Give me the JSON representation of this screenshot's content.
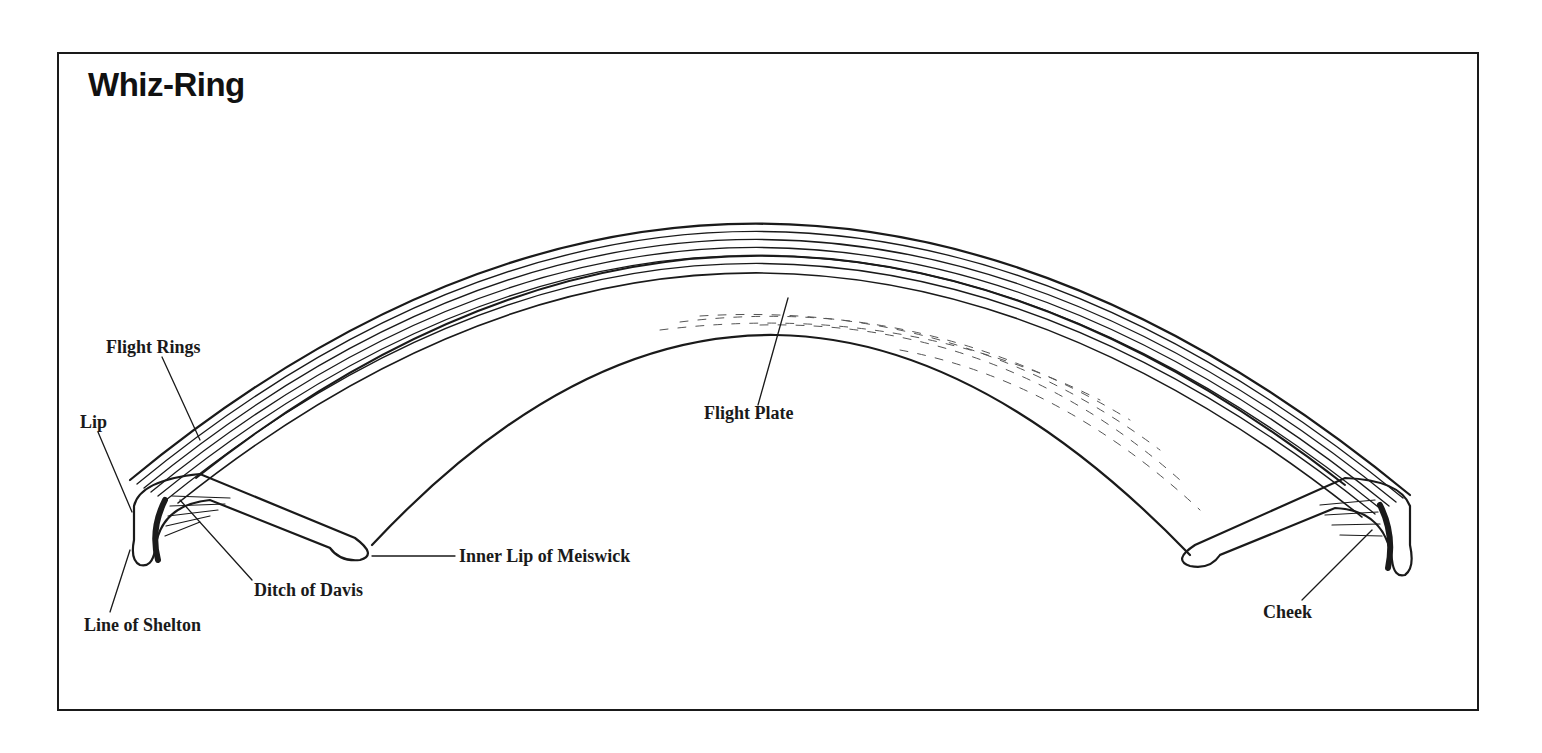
{
  "title": "Whiz-Ring",
  "labels": {
    "flight_rings": "Flight Rings",
    "lip": "Lip",
    "line_of_shelton": "Line of Shelton",
    "ditch_of_davis": "Ditch of Davis",
    "inner_lip_of_meiswick": "Inner Lip of Meiswick",
    "flight_plate": "Flight Plate",
    "cheek": "Cheek"
  },
  "colors": {
    "ink": "#1a1a1a",
    "background": "#ffffff"
  }
}
